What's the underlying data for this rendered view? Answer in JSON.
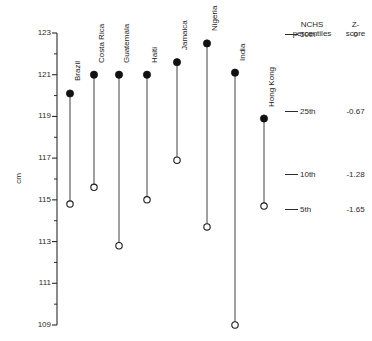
{
  "chart_data": {
    "type": "scatter",
    "title": "",
    "subtitle": "",
    "xlabel": "",
    "ylabel": "cm",
    "ylim": [
      109,
      123
    ],
    "yticks": [
      109,
      111,
      113,
      115,
      117,
      119,
      121,
      123
    ],
    "ytick_labels": [
      "109",
      "111",
      "113",
      "115",
      "117",
      "119",
      "121",
      "123"
    ],
    "yminor_step": 1,
    "grid": false,
    "legend_position": "right",
    "categories": [
      "Brazil",
      "Costa Rica",
      "Guatemala",
      "Haiti",
      "Jamaica",
      "Nigeria",
      "India",
      "Hong Kong"
    ],
    "series": [
      {
        "name": "Upper value (filled circle)",
        "marker": "filled-circle",
        "values": [
          120.1,
          121.0,
          121.0,
          121.0,
          121.6,
          122.5,
          121.1,
          118.9
        ]
      },
      {
        "name": "Lower value (open circle)",
        "marker": "open-circle",
        "values": [
          114.8,
          115.6,
          112.8,
          115.0,
          116.9,
          113.7,
          109.0,
          114.7
        ]
      }
    ],
    "points": [
      {
        "category": "Brazil",
        "high": 120.1,
        "low": 114.8
      },
      {
        "category": "Costa Rica",
        "high": 121.0,
        "low": 115.6
      },
      {
        "category": "Guatemala",
        "high": 121.0,
        "low": 112.8
      },
      {
        "category": "Haiti",
        "high": 121.0,
        "low": 115.0
      },
      {
        "category": "Jamaica",
        "high": 121.6,
        "low": 116.9
      },
      {
        "category": "Nigeria",
        "high": 122.5,
        "low": 113.7
      },
      {
        "category": "India",
        "high": 121.1,
        "low": 109.0
      },
      {
        "category": "Hong Kong",
        "high": 118.9,
        "low": 114.7
      }
    ],
    "reference_lines": {
      "header_percentiles": "NCHS\npercentiles",
      "header_zscore": "Z-\nscore",
      "rows": [
        {
          "percentile": "50th",
          "z": "0",
          "cm": 122.9
        },
        {
          "percentile": "25th",
          "z": "-0.67",
          "cm": 119.2
        },
        {
          "percentile": "10th",
          "z": "-1.28",
          "cm": 116.2
        },
        {
          "percentile": "5th",
          "z": "-1.65",
          "cm": 114.5
        }
      ]
    },
    "colors": {
      "line": "#2b2b2b",
      "filled_marker": "#111111",
      "open_marker_fill": "#ffffff",
      "background": "#ffffff"
    }
  },
  "axis": {
    "title": "cm",
    "tick_labels": [
      "123",
      "121",
      "119",
      "117",
      "115",
      "113",
      "111",
      "109"
    ]
  },
  "countries": [
    {
      "label": "Brazil"
    },
    {
      "label": "Costa Rica"
    },
    {
      "label": "Guatemala"
    },
    {
      "label": "Haiti"
    },
    {
      "label": "Jamaica"
    },
    {
      "label": "Nigeria"
    },
    {
      "label": "India"
    },
    {
      "label": "Hong Kong"
    }
  ],
  "legend": {
    "header_percentiles_line1": "NCHS",
    "header_percentiles_line2": "percentiles",
    "header_z_line1": "Z-",
    "header_z_line2": "score",
    "rows": [
      {
        "percentile": "50th",
        "z": "0"
      },
      {
        "percentile": "25th",
        "z": "-0.67"
      },
      {
        "percentile": "10th",
        "z": "-1.28"
      },
      {
        "percentile": "5th",
        "z": "-1.65"
      }
    ]
  }
}
